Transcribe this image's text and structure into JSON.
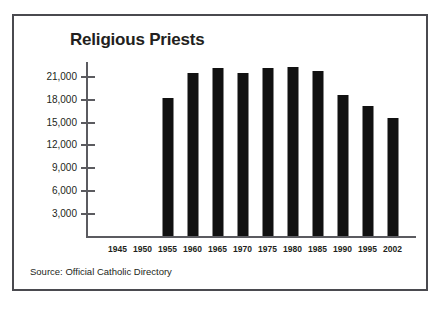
{
  "figure": {
    "title": "Religious Priests",
    "source_note": "Source: Official Catholic Directory",
    "border_color": "#4a4a4f",
    "background_color": "#ffffff",
    "bar_color": "#111111",
    "axis_color": "#5b5b60",
    "text_color": "#231f20"
  },
  "chart_data": {
    "type": "bar",
    "title": "Religious Priests",
    "subtitle": "",
    "xlabel": "",
    "ylabel": "",
    "categories": [
      "1945",
      "1950",
      "1955",
      "1960",
      "1965",
      "1970",
      "1975",
      "1980",
      "1985",
      "1990",
      "1995",
      "2002"
    ],
    "values": [
      null,
      null,
      18100,
      21300,
      22000,
      21400,
      22000,
      22200,
      21600,
      18500,
      17000,
      15400
    ],
    "ylim": [
      0,
      22800
    ],
    "yticks": [
      3000,
      6000,
      9000,
      12000,
      15000,
      18000,
      21000
    ],
    "ytick_labels": [
      "3,000",
      "6,000",
      "9,000",
      "12,000",
      "15,000",
      "18,000",
      "21,000"
    ],
    "grid": false,
    "legend": "none"
  }
}
